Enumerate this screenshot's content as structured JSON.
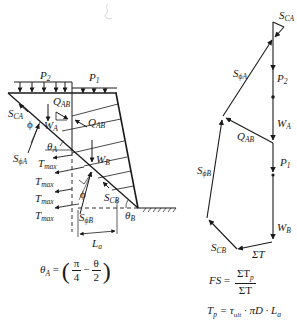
{
  "left_diagram": {
    "labels": {
      "P2": {
        "base": "P",
        "sub": "2"
      },
      "P1": {
        "base": "P",
        "sub": "1"
      },
      "QAB_upper": {
        "base": "Q",
        "sub": "AB"
      },
      "QAB_lower": {
        "base": "Q",
        "sub": "AB"
      },
      "SCA": {
        "base": "S",
        "sub": "CA"
      },
      "phi_A": "ϕ",
      "WA": {
        "base": "W",
        "sub": "A"
      },
      "thetaA": {
        "base": "θ",
        "sub": "A"
      },
      "SphiA": {
        "base": "S",
        "sub": "ϕA"
      },
      "WB": {
        "base": "W",
        "sub": "B"
      },
      "Tmax_1": {
        "base": "T",
        "sub": "max"
      },
      "Tmax_2": {
        "base": "T",
        "sub": "max"
      },
      "Tmax_3": {
        "base": "T",
        "sub": "max"
      },
      "Tmax_4": {
        "base": "T",
        "sub": "max"
      },
      "phi_B": "ϕ",
      "SCB": {
        "base": "S",
        "sub": "CB"
      },
      "SphiB": {
        "base": "S",
        "sub": "ϕB"
      },
      "thetaB": {
        "base": "θ",
        "sub": "B"
      },
      "La": {
        "base": "L",
        "sub": "a"
      }
    },
    "equation_thetaA": {
      "lhs_base": "θ",
      "lhs_sub": "A",
      "equals": "=",
      "open_paren": "(",
      "frac1_num": "π",
      "frac1_den": "4",
      "minus": "−",
      "frac2_num": "θ",
      "frac2_den": "2",
      "close_paren": ")"
    }
  },
  "force_polygon": {
    "labels": {
      "SCA": {
        "base": "S",
        "sub": "CA"
      },
      "SphiA": {
        "base": "S",
        "sub": "ϕA"
      },
      "P2": {
        "base": "P",
        "sub": "2"
      },
      "WA": {
        "base": "W",
        "sub": "A"
      },
      "QAB": {
        "base": "Q",
        "sub": "AB"
      },
      "P1": {
        "base": "P",
        "sub": "1"
      },
      "SphiB": {
        "base": "S",
        "sub": "ϕB"
      },
      "WB": {
        "base": "W",
        "sub": "B"
      },
      "SCB": {
        "base": "S",
        "sub": "CB"
      },
      "SigmaT": "ΣT"
    }
  },
  "equations": {
    "FS": {
      "lhs": "FS",
      "equals": "=",
      "num_base": "ΣT",
      "num_sub": "p",
      "den": "ΣT"
    },
    "Tp": {
      "lhs_base": "T",
      "lhs_sub": "p",
      "rhs_a": "= τ",
      "rhs_sub": "ult",
      "rhs_b": " · πD · L",
      "rhs_sub2": "a"
    }
  },
  "colors": {
    "ink": "#1a1a1a",
    "background": "#ffffff"
  }
}
